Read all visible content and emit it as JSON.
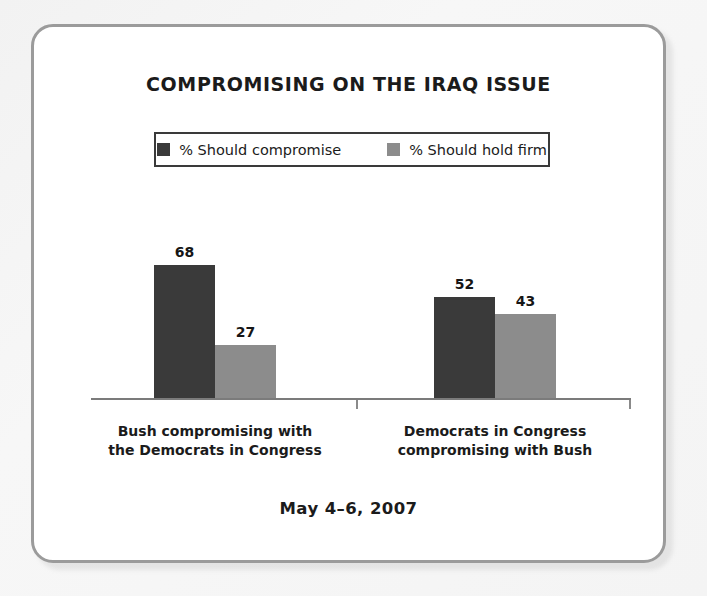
{
  "card": {
    "title": "COMPROMISING ON THE IRAQ ISSUE",
    "date_label": "May 4–6, 2007"
  },
  "legend": {
    "entries": [
      {
        "label": "% Should compromise",
        "color": "#3a3a3a",
        "swatch_name": "legend-swatch-compromise"
      },
      {
        "label": "% Should hold firm",
        "color": "#8c8c8c",
        "swatch_name": "legend-swatch-hold-firm"
      }
    ]
  },
  "chart_data": {
    "type": "bar",
    "title": "COMPROMISING ON THE IRAQ ISSUE",
    "subtitle": "May 4–6, 2007",
    "xlabel": "",
    "ylabel": "",
    "ylim": [
      0,
      100
    ],
    "grid": false,
    "legend_position": "top",
    "categories": [
      "Bush compromising with the Democrats in Congress",
      "Democrats in Congress compromising with Bush"
    ],
    "category_lines": [
      [
        "Bush compromising with",
        "the Democrats in Congress"
      ],
      [
        "Democrats in Congress",
        "compromising with Bush"
      ]
    ],
    "series": [
      {
        "name": "% Should compromise",
        "color": "#3a3a3a",
        "values": [
          68,
          52
        ]
      },
      {
        "name": "% Should hold firm",
        "color": "#8c8c8c",
        "values": [
          27,
          43
        ]
      }
    ],
    "annotations": [
      "68",
      "27",
      "52",
      "43"
    ]
  }
}
